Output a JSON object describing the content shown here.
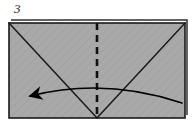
{
  "figure": {
    "step_label": "3",
    "background_color": "#ffffff"
  },
  "colors": {
    "paper_fill": "#a8a8a8",
    "paper_stroke": "#1a1a1a",
    "shadow_edge": "#303030",
    "crease_line": "#1a1a1a",
    "fold_line": "#111111",
    "arrow": "#000000",
    "hatch": "#9b9b9b",
    "text": "#2b2b2b"
  },
  "paper": {
    "name": "rectangle-sheet",
    "x": 9,
    "y": 23,
    "width": 176,
    "height": 95,
    "stroke_width": 1.6,
    "shadow_offset_x": 2,
    "shadow_offset_y": -3
  },
  "creases": [
    {
      "name": "diagonal-left-crease",
      "type": "valley",
      "x1": 9,
      "y1": 23,
      "x2": 97,
      "y2": 118
    },
    {
      "name": "diagonal-right-crease",
      "type": "valley",
      "x1": 185,
      "y1": 23,
      "x2": 97,
      "y2": 118
    }
  ],
  "fold_line": {
    "name": "vertical-fold-line",
    "style": "dashed",
    "x": 97,
    "y1": 23,
    "y2": 118,
    "dash_length": 7,
    "dash_gap": 5,
    "stroke_width": 2.6
  },
  "arrow": {
    "name": "fold-direction-arrow",
    "direction": "right-to-left",
    "start_x": 182,
    "start_y": 103,
    "control_x": 105,
    "control_y": 77,
    "end_x": 30,
    "end_y": 96,
    "stroke_width": 1.7,
    "head_length": 17,
    "head_width": 12
  }
}
